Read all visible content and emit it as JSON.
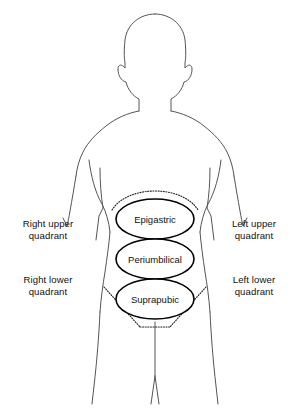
{
  "figure": {
    "colors": {
      "background": "#ffffff",
      "outline": "#545454",
      "guide_line": "#1a1a1a",
      "ellipse_stroke": "#000000",
      "ellipse_fill": "#ffffff",
      "text": "#111111"
    }
  },
  "regions": [
    {
      "id": "epigastric",
      "label": "Epigastric",
      "cx": 155,
      "cy": 219,
      "rx": 39,
      "ry": 20
    },
    {
      "id": "periumbilical",
      "label": "Periumbilical",
      "cx": 155,
      "cy": 259,
      "rx": 39,
      "ry": 20
    },
    {
      "id": "suprapubic",
      "label": "Suprapubic",
      "cx": 155,
      "cy": 299,
      "rx": 39,
      "ry": 20
    }
  ],
  "quadrants": {
    "right_upper": "Right upper\nquadrant",
    "left_upper": "Left upper\nquadrant",
    "right_lower": "Right lower\nquadrant",
    "left_lower": "Left lower\nquadrant"
  }
}
